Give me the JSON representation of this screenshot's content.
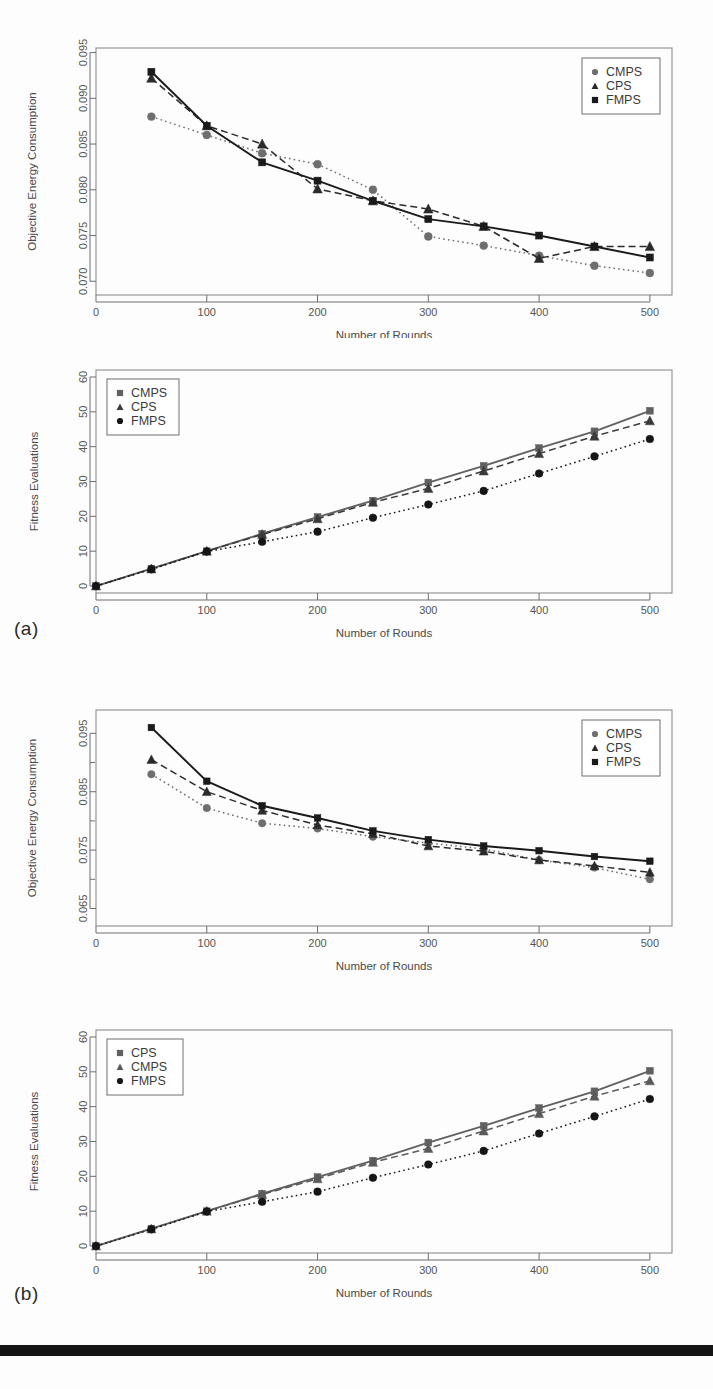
{
  "document": {
    "panel_a_label": "(a)",
    "panel_b_label": "(b)"
  },
  "chart_data": [
    {
      "id": "chart-a-energy",
      "type": "line",
      "title": "",
      "xlabel": "Number of Rounds",
      "ylabel": "Objective Energy Consumption",
      "xlim": [
        0,
        520
      ],
      "ylim": [
        0.0685,
        0.0955
      ],
      "xticks": [
        0,
        100,
        200,
        300,
        400,
        500
      ],
      "xticklabels": [
        "0",
        "100",
        "200",
        "300",
        "400",
        "500"
      ],
      "yticks": [
        0.07,
        0.075,
        0.08,
        0.085,
        0.09,
        0.095
      ],
      "yticklabels": [
        "0.070",
        "0.075",
        "0.080",
        "0.085",
        "0.090",
        "0.095"
      ],
      "grid": false,
      "legend_position": "top-right",
      "x": [
        50,
        100,
        150,
        200,
        250,
        300,
        350,
        400,
        450,
        500
      ],
      "series": [
        {
          "name": "CMPS",
          "marker": "circle",
          "linestyle": "dotted",
          "color": "#6e6e6e",
          "values": [
            0.088,
            0.086,
            0.084,
            0.0828,
            0.08,
            0.0749,
            0.0739,
            0.0728,
            0.0717,
            0.0709
          ]
        },
        {
          "name": "CPS",
          "marker": "triangle",
          "linestyle": "dashed",
          "color": "#2a2a2a",
          "values": [
            0.0922,
            0.087,
            0.085,
            0.0801,
            0.0788,
            0.0779,
            0.076,
            0.0725,
            0.0738,
            0.0738
          ]
        },
        {
          "name": "FMPS",
          "marker": "square",
          "linestyle": "solid",
          "color": "#1a1a1a",
          "values": [
            0.0929,
            0.087,
            0.083,
            0.081,
            0.0788,
            0.0768,
            0.076,
            0.075,
            0.0738,
            0.0726
          ]
        }
      ]
    },
    {
      "id": "chart-a-fitness",
      "type": "line",
      "title": "",
      "xlabel": "Number of Rounds",
      "ylabel": "Fitness Evaluations",
      "xlim": [
        0,
        520
      ],
      "ylim": [
        -2,
        62
      ],
      "xticks": [
        0,
        100,
        200,
        300,
        400,
        500
      ],
      "xticklabels": [
        "0",
        "100",
        "200",
        "300",
        "400",
        "500"
      ],
      "yticks": [
        0,
        10,
        20,
        30,
        40,
        50,
        60
      ],
      "yticklabels": [
        "0",
        "10",
        "20",
        "30",
        "40",
        "50",
        "60"
      ],
      "grid": false,
      "legend_position": "top-left",
      "x": [
        0,
        50,
        100,
        150,
        200,
        250,
        300,
        350,
        400,
        450,
        500
      ],
      "series": [
        {
          "name": "CMPS",
          "marker": "square",
          "linestyle": "solid",
          "color": "#616161",
          "values": [
            0,
            5.0,
            10.0,
            15.0,
            19.8,
            24.5,
            29.7,
            34.5,
            39.6,
            44.4,
            50.3
          ]
        },
        {
          "name": "CPS",
          "marker": "triangle",
          "linestyle": "dashed",
          "color": "#3a3a3a",
          "values": [
            0,
            4.9,
            10.0,
            14.8,
            19.3,
            24.0,
            28.0,
            33.0,
            38.0,
            43.0,
            47.4
          ]
        },
        {
          "name": "FMPS",
          "marker": "circle",
          "linestyle": "dotted",
          "color": "#151515",
          "values": [
            0,
            4.8,
            9.9,
            12.7,
            15.6,
            19.6,
            23.4,
            27.3,
            32.3,
            37.2,
            42.2
          ]
        }
      ]
    },
    {
      "id": "chart-b-energy",
      "type": "line",
      "title": "",
      "xlabel": "Number of Rounds",
      "ylabel": "Objective Energy Consumption",
      "xlim": [
        0,
        520
      ],
      "ylim": [
        0.062,
        0.099
      ],
      "xticks": [
        0,
        100,
        200,
        300,
        400,
        500
      ],
      "xticklabels": [
        "0",
        "100",
        "200",
        "300",
        "400",
        "500"
      ],
      "yticks": [
        0.065,
        0.075,
        0.085,
        0.095
      ],
      "yticklabels": [
        "0.065",
        "0.075",
        "0.085",
        "0.095"
      ],
      "yminorticks": [
        0.07,
        0.08,
        0.09
      ],
      "grid": false,
      "legend_position": "top-right",
      "x": [
        50,
        100,
        150,
        200,
        250,
        300,
        350,
        400,
        450,
        500
      ],
      "series": [
        {
          "name": "CMPS",
          "marker": "circle",
          "linestyle": "dotted",
          "color": "#6e6e6e",
          "values": [
            0.088,
            0.0822,
            0.0796,
            0.0787,
            0.0773,
            0.0762,
            0.0752,
            0.0733,
            0.072,
            0.07
          ]
        },
        {
          "name": "CPS",
          "marker": "triangle",
          "linestyle": "dashed",
          "color": "#2a2a2a",
          "values": [
            0.0905,
            0.085,
            0.0818,
            0.0793,
            0.0778,
            0.0757,
            0.0748,
            0.0733,
            0.0723,
            0.0712
          ]
        },
        {
          "name": "FMPS",
          "marker": "square",
          "linestyle": "solid",
          "color": "#1a1a1a",
          "values": [
            0.096,
            0.0868,
            0.0826,
            0.0805,
            0.0783,
            0.0768,
            0.0757,
            0.0749,
            0.0739,
            0.0731
          ]
        }
      ]
    },
    {
      "id": "chart-b-fitness",
      "type": "line",
      "title": "",
      "xlabel": "Number of Rounds",
      "ylabel": "Fitness Evaluations",
      "xlim": [
        0,
        520
      ],
      "ylim": [
        -2,
        62
      ],
      "xticks": [
        0,
        100,
        200,
        300,
        400,
        500
      ],
      "xticklabels": [
        "0",
        "100",
        "200",
        "300",
        "400",
        "500"
      ],
      "yticks": [
        0,
        10,
        20,
        30,
        40,
        50,
        60
      ],
      "yticklabels": [
        "0",
        "10",
        "20",
        "30",
        "40",
        "50",
        "60"
      ],
      "grid": false,
      "legend_position": "top-left",
      "x": [
        0,
        50,
        100,
        150,
        200,
        250,
        300,
        350,
        400,
        450,
        500
      ],
      "series": [
        {
          "name": "CPS",
          "marker": "square",
          "linestyle": "solid",
          "color": "#616161",
          "values": [
            0,
            5.0,
            10.0,
            15.0,
            19.8,
            24.5,
            29.7,
            34.5,
            39.6,
            44.4,
            50.3
          ]
        },
        {
          "name": "CMPS",
          "marker": "triangle",
          "linestyle": "dashed",
          "color": "#5a5a5a",
          "values": [
            0,
            4.9,
            10.0,
            14.8,
            19.3,
            24.0,
            28.0,
            33.0,
            38.0,
            43.0,
            47.4
          ]
        },
        {
          "name": "FMPS",
          "marker": "circle",
          "linestyle": "dotted",
          "color": "#151515",
          "values": [
            0,
            4.8,
            9.9,
            12.7,
            15.6,
            19.6,
            23.4,
            27.3,
            32.3,
            37.2,
            42.2
          ]
        }
      ]
    }
  ]
}
